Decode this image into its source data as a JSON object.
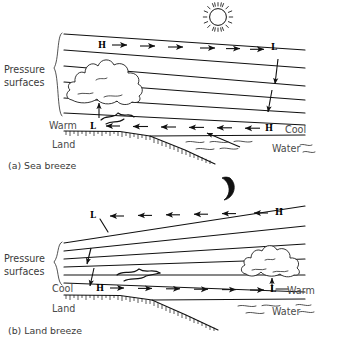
{
  "figure": {
    "background": "#ffffff",
    "ink": "#111111",
    "label_color": "#3a3a3a"
  },
  "panels": [
    {
      "id": "sea-breeze",
      "caption": "(a) Sea breeze",
      "sky_object": "sun-icon",
      "bracket_label_line1": "Pressure",
      "bracket_label_line2": "surfaces",
      "surface_left_label": "Warm",
      "surface_left_sublabel": "Land",
      "surface_right_label": "Cool",
      "surface_right_sublabel": "Water",
      "aloft_left_marker": "H",
      "aloft_right_marker": "L",
      "aloft_flow_direction": "right",
      "surface_left_marker": "L",
      "surface_right_marker": "H",
      "surface_flow_direction": "left",
      "cloud_position": "over-land",
      "pressure_surface_count": 6
    },
    {
      "id": "land-breeze",
      "caption": "(b) Land breeze",
      "sky_object": "moon-icon",
      "bracket_label_line1": "Pressure",
      "bracket_label_line2": "surfaces",
      "surface_left_label": "Cool",
      "surface_left_sublabel": "Land",
      "surface_right_label": "Warm",
      "surface_right_sublabel": "Water",
      "aloft_left_marker": "L",
      "aloft_right_marker": "H",
      "aloft_flow_direction": "left",
      "surface_left_marker": "H",
      "surface_right_marker": "L",
      "surface_flow_direction": "right",
      "cloud_position": "over-water",
      "pressure_surface_count": 6
    }
  ]
}
